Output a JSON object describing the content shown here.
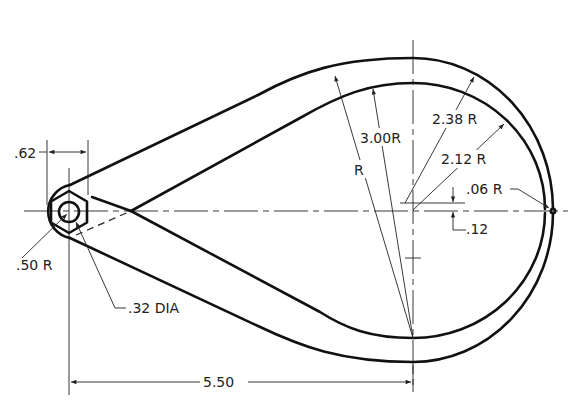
{
  "drawing": {
    "title": "Cam arm technical drawing",
    "dimensions": {
      "hub_width": ".62",
      "hub_radius": ".50 R",
      "hole_diameter": ".32 DIA",
      "overall_length": "5.50",
      "large_radius": "3.00R",
      "radius_unspecified": "R",
      "outer_radius": "2.38 R",
      "inner_radius": "2.12 R",
      "tip_fillet": ".06 R",
      "center_offset": ".12"
    },
    "colors": {
      "line": "#111111",
      "background": "#ffffff"
    }
  }
}
